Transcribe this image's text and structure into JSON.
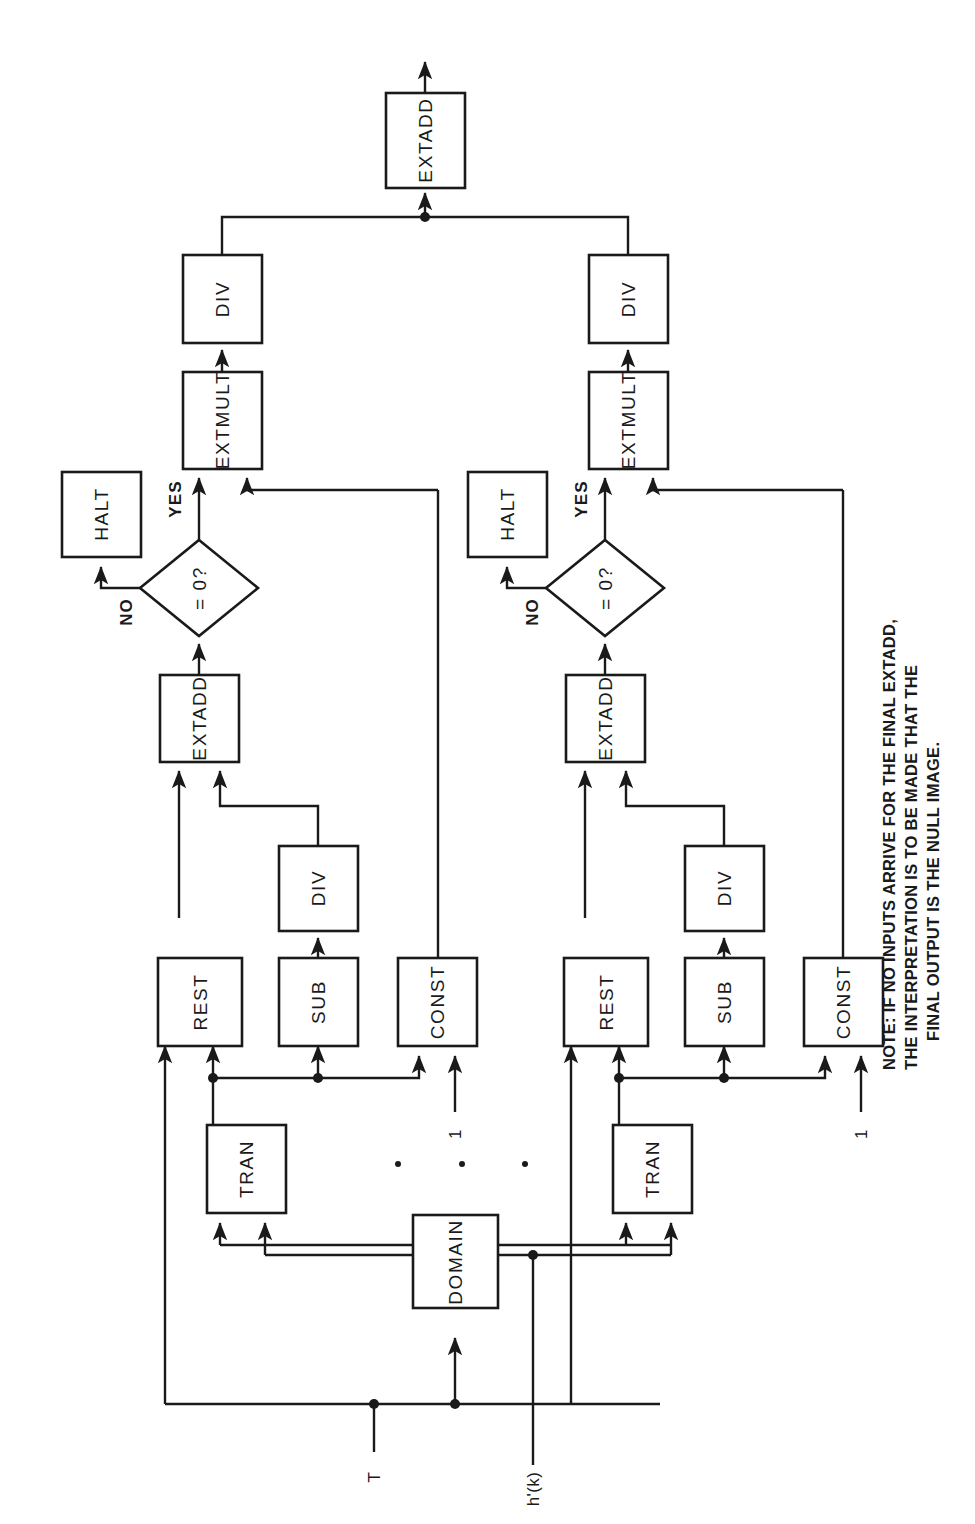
{
  "diagram": {
    "orientation": "rotated-90-ccw",
    "stroke_color": "#1a1a1a",
    "background_color": "#ffffff",
    "nodes": {
      "final_extadd": "EXTADD",
      "left": {
        "div": "DIV",
        "extmult": "EXTMULT",
        "halt": "HALT",
        "decision": "= 0?",
        "extadd": "EXTADD",
        "div2": "DIV",
        "rest": "REST",
        "sub": "SUB",
        "const": "CONST",
        "tran": "TRAN"
      },
      "right": {
        "div": "DIV",
        "extmult": "EXTMULT",
        "halt": "HALT",
        "decision": "= 0?",
        "extadd": "EXTADD",
        "div2": "DIV",
        "rest": "REST",
        "sub": "SUB",
        "const": "CONST",
        "tran": "TRAN"
      },
      "domain": "DOMAIN"
    },
    "edge_labels": {
      "left_yes": "YES",
      "left_no": "NO",
      "right_yes": "YES",
      "right_no": "NO"
    },
    "inputs": {
      "const_left": "1",
      "const_right": "1",
      "t": "T",
      "hk": "h'(k)"
    },
    "note": {
      "line1": "NOTE:  IF NO INPUTS ARRIVE FOR THE FINAL EXTADD,",
      "line2": "THE INTERPRETATION IS TO BE MADE THAT THE",
      "line3": "FINAL OUTPUT IS THE NULL IMAGE."
    },
    "ellipsis": "· · ·"
  }
}
